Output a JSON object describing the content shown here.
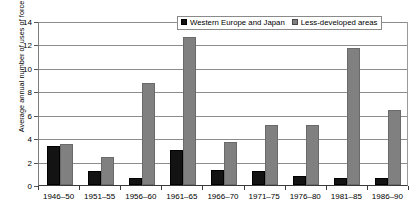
{
  "chart_data": {
    "type": "bar",
    "title": "",
    "xlabel": "",
    "ylabel": "Average annual number of uses of force",
    "ylim": [
      0,
      14
    ],
    "yticks": [
      0,
      2,
      4,
      6,
      8,
      10,
      12,
      14
    ],
    "grid": true,
    "legend_position": "top-right",
    "categories": [
      "1946–50",
      "1951–55",
      "1956–60",
      "1961–65",
      "1966–70",
      "1971–75",
      "1976–80",
      "1981–85",
      "1986–90"
    ],
    "series": [
      {
        "name": "Western Europe and Japan",
        "color": "#131313",
        "values": [
          3.3,
          1.2,
          0.6,
          3.0,
          1.3,
          1.2,
          0.8,
          0.6,
          0.6
        ]
      },
      {
        "name": "Less-developed areas",
        "color": "#808080",
        "values": [
          3.5,
          2.4,
          8.7,
          12.6,
          3.7,
          5.1,
          5.1,
          11.7,
          6.4
        ]
      }
    ]
  },
  "legend": {
    "items": [
      {
        "label": "Western Europe and Japan",
        "swatch": "black-square-icon"
      },
      {
        "label": "Less-developed areas",
        "swatch": "gray-square-icon"
      }
    ]
  }
}
